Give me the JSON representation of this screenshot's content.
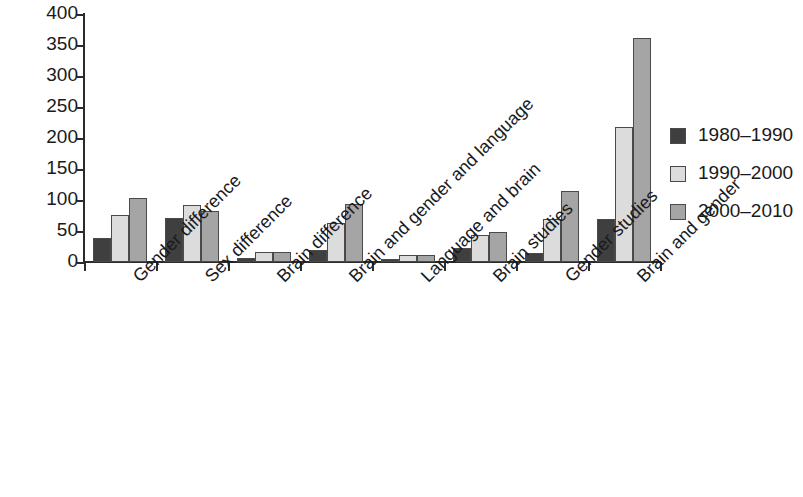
{
  "chart_data": {
    "type": "bar",
    "title": "",
    "subtitle": "",
    "xlabel": "",
    "ylabel": "",
    "ylim": [
      0,
      400
    ],
    "ytick_values": [
      0,
      50,
      100,
      150,
      200,
      250,
      300,
      350,
      400
    ],
    "ytick_labels": [
      "0",
      "50",
      "100",
      "150",
      "200",
      "250",
      "300",
      "350",
      "400"
    ],
    "grid": false,
    "legend_position": "right",
    "categories": [
      "Gender difference",
      "Sex difference",
      "Brain difference",
      "Brain and gender and language",
      "Language and brain",
      "Brain studies",
      "Gender studies",
      "Brain and gender"
    ],
    "series": [
      {
        "name": "1980–1990",
        "color": "#3f3f3f",
        "values": [
          39,
          71,
          6,
          19,
          4,
          22,
          14,
          69
        ]
      },
      {
        "name": "1990–2000",
        "color": "#dcdcdc",
        "values": [
          76,
          92,
          16,
          63,
          12,
          44,
          69,
          217
        ]
      },
      {
        "name": "2000–2010",
        "color": "#a5a5a5",
        "values": [
          104,
          82,
          16,
          93,
          12,
          49,
          114,
          362
        ]
      }
    ]
  }
}
